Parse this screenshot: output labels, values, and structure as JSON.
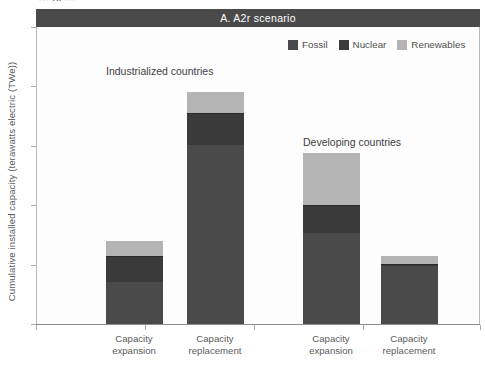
{
  "figure": {
    "clipped_top_text": "… ol …",
    "panel_title": "A.  A2r scenario"
  },
  "legend": {
    "entries": [
      {
        "label": "Fossil",
        "color": "#4a4a4a"
      },
      {
        "label": "Nuclear",
        "color": "#3a3a3a"
      },
      {
        "label": "Renewables",
        "color": "#b4b4b4"
      }
    ]
  },
  "annotations": {
    "industrialized": "Industrialized countries",
    "developing": "Developing countries"
  },
  "axes": {
    "y_title": "Cumulative installed capacity (terawatts electric (TWe))",
    "y_ticks": [
      "0",
      "5",
      "10",
      "15",
      "20",
      "25"
    ],
    "x_labels": [
      {
        "line1": "Capacity",
        "line2": "expansion"
      },
      {
        "line1": "Capacity",
        "line2": "replacement"
      },
      {
        "line1": "Capacity",
        "line2": "expansion"
      },
      {
        "line1": "Capacity",
        "line2": "replacement"
      }
    ]
  },
  "chart_data": {
    "type": "bar",
    "title": "A.  A2r scenario",
    "xlabel": "",
    "ylabel": "Cumulative installed capacity (terawatts electric (TWe))",
    "ylim": [
      0,
      25
    ],
    "grid": false,
    "legend_position": "top-right",
    "stacked": true,
    "groups": [
      {
        "name": "Industrialized countries",
        "categories": [
          "Capacity expansion",
          "Capacity replacement"
        ]
      },
      {
        "name": "Developing countries",
        "categories": [
          "Capacity expansion",
          "Capacity replacement"
        ]
      }
    ],
    "categories": [
      "Industrialized – Capacity expansion",
      "Industrialized – Capacity replacement",
      "Developing – Capacity expansion",
      "Developing – Capacity replacement"
    ],
    "series": [
      {
        "name": "Fossil",
        "color": "#4a4a4a",
        "values": [
          3.5,
          15.1,
          7.7,
          4.9
        ]
      },
      {
        "name": "Nuclear",
        "color": "#3a3a3a",
        "values": [
          2.2,
          2.7,
          2.3,
          0.15
        ]
      },
      {
        "name": "Renewables",
        "color": "#b4b4b4",
        "values": [
          1.3,
          1.7,
          4.4,
          0.65
        ]
      }
    ],
    "totals": [
      7.0,
      19.5,
      14.4,
      5.7
    ]
  }
}
